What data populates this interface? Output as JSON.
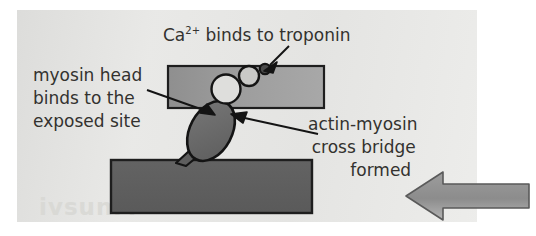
{
  "figure": {
    "watermark_text": "ivsunM",
    "background_color": "#ffffff",
    "panel_color": "#e6e6e4"
  },
  "labels": {
    "calcium": {
      "text_prefix": "Ca",
      "superscript": "2+",
      "text_suffix": " binds to troponin",
      "full_text": "Ca2+ binds to troponin"
    },
    "myosin_head": {
      "line1": "myosin head",
      "line2": "binds to the",
      "line3": "exposed site"
    },
    "cross_bridge": {
      "line1": "actin-myosin",
      "line2": "cross bridge",
      "line3": "formed"
    }
  },
  "structures": {
    "actin_filament": {
      "name": "actin filament",
      "fill_color": "#9a9a9a",
      "stroke_color": "#1e1e1e"
    },
    "myosin_filament": {
      "name": "myosin filament",
      "fill_color": "#5f5f5f",
      "stroke_color": "#1e1e1e"
    },
    "myosin_head": {
      "name": "myosin head",
      "fill_color": "#6b6b6b",
      "stroke_color": "#141414"
    },
    "troponin_complex": {
      "name": "troponin complex",
      "circle_large_fill": "#dcdcda",
      "circle_medium_fill": "#c9c9c7",
      "circle_small_fill": "#4a4a4a",
      "stroke_color": "#141414"
    },
    "sliding_arrow": {
      "name": "sliding direction arrow",
      "fill_color": "#8e8e8e",
      "stroke_color": "#4c4c4c",
      "direction": "left"
    }
  }
}
